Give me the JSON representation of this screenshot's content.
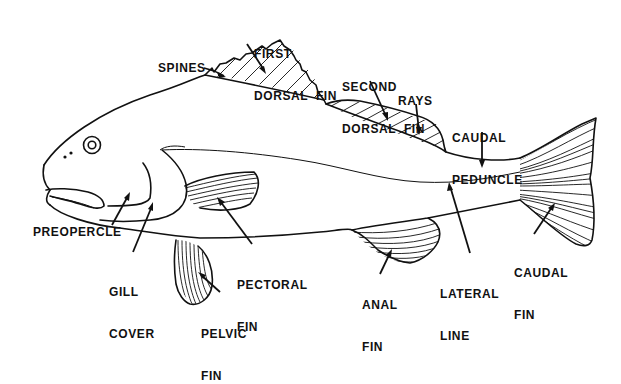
{
  "diagram": {
    "type": "labeled anatomical illustration",
    "colors": {
      "ink": "#111111",
      "background": "#ffffff"
    },
    "labels": {
      "first_dorsal_fin": {
        "line1": "FIRST",
        "line2": "DORSAL  FIN"
      },
      "spines": "SPINES",
      "second_dorsal_fin": {
        "line1": "SECOND",
        "line2": "DORSAL  FIN"
      },
      "rays": "RAYS",
      "caudal_peduncle": {
        "line1": "CAUDAL",
        "line2": "PEDUNCLE"
      },
      "preopercle": "PREOPERCLE",
      "gill_cover": {
        "line1": "GILL",
        "line2": "COVER"
      },
      "pectoral_fin": {
        "line1": "PECTORAL",
        "line2": "FIN"
      },
      "pelvic_fin": {
        "line1": "PELVIC",
        "line2": "FIN"
      },
      "anal_fin": {
        "line1": "ANAL",
        "line2": "FIN"
      },
      "lateral_line": {
        "line1": "LATERAL",
        "line2": "LINE"
      },
      "caudal_fin": {
        "line1": "CAUDAL",
        "line2": "FIN"
      }
    }
  }
}
